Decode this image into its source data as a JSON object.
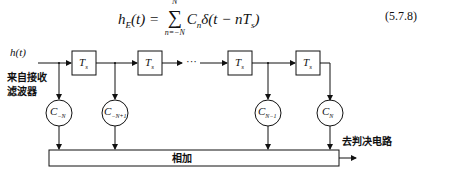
{
  "equation": {
    "lhs": "h",
    "lhs_sub": "E",
    "lhs_arg": "(t) =",
    "sum_upper": "N",
    "sum_lower": "n=−N",
    "sum_symbol": "∑",
    "body": "C",
    "body_sub": "n",
    "body_rest": "δ(t − nT",
    "body_rest_sub": "s",
    "body_close": ")",
    "number": "(5.7.8)"
  },
  "diagram": {
    "input_signal": "h(t)",
    "input_label_line1": "来自接收",
    "input_label_line2": "滤波器",
    "delay_label": "T",
    "delay_sub": "s",
    "ellipsis": "···",
    "taps": [
      {
        "main": "C",
        "sub": "−N"
      },
      {
        "main": "C",
        "sub": "−N+1"
      },
      {
        "main": "C",
        "sub": "N−1"
      },
      {
        "main": "C",
        "sub": "N"
      }
    ],
    "adder_label": "相加",
    "output_label": "去判决电路"
  }
}
